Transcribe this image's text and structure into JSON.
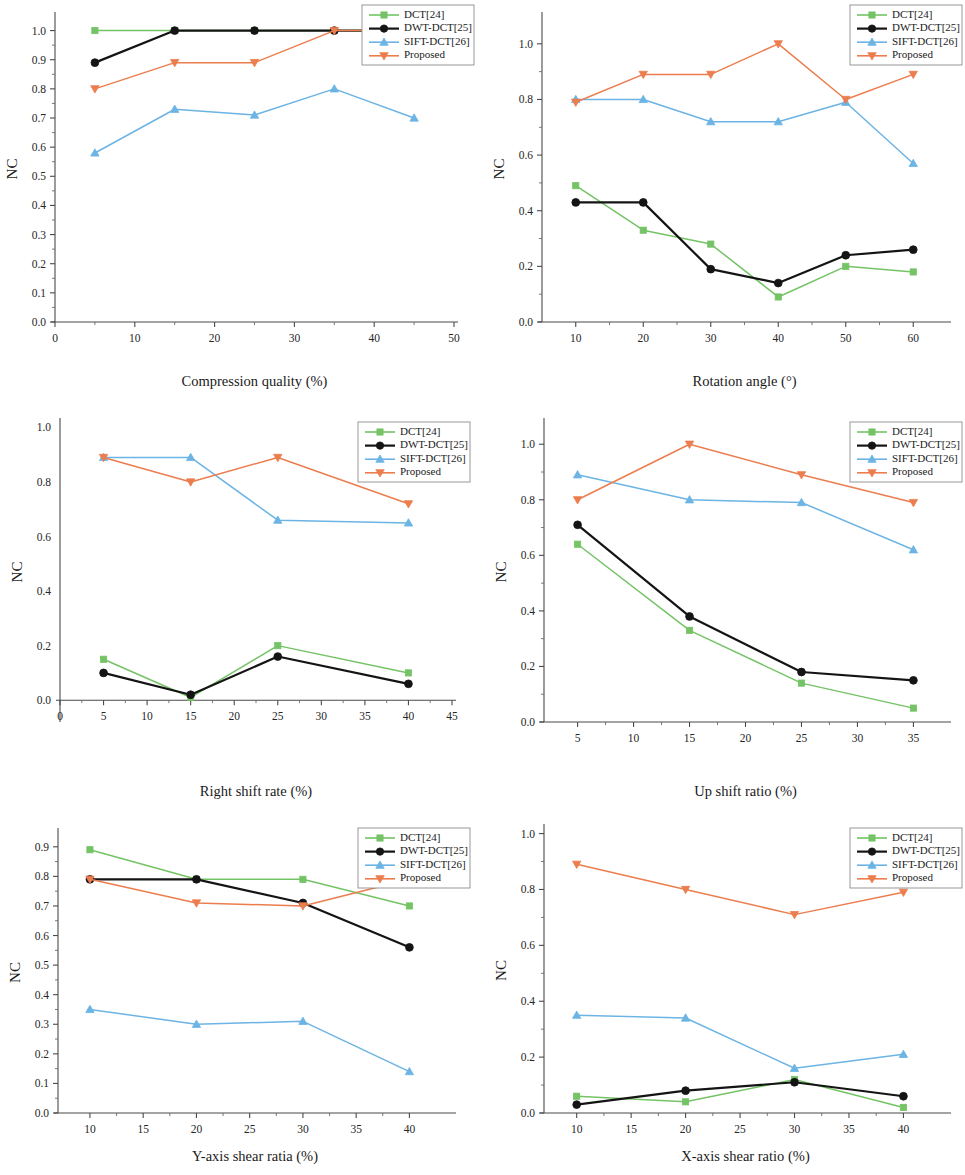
{
  "figure": {
    "series_names": [
      "DCT[24]",
      "DWT-DCT[25]",
      "SIFT-DCT[26]",
      "Proposed"
    ],
    "series_colors": [
      "#74C365",
      "#141414",
      "#6CB4E4",
      "#EC7D4E"
    ],
    "series_markers": [
      "square",
      "circle",
      "triangle-up",
      "triangle-down"
    ],
    "shared_ylabel": "NC"
  },
  "chart_data": [
    {
      "id": "compression-quality",
      "type": "line",
      "title": "",
      "xlabel": "Compression quality (%)",
      "ylabel": "NC",
      "x": [
        5,
        15,
        25,
        35,
        45
      ],
      "xlim": [
        0,
        50
      ],
      "ylim": [
        0.0,
        1.05
      ],
      "xticks": [
        0,
        10,
        20,
        30,
        40,
        50
      ],
      "xtick_labels": [
        "0",
        "10",
        "20",
        "30",
        "40",
        "50"
      ],
      "yticks": [
        0.0,
        0.1,
        0.2,
        0.3,
        0.4,
        0.5,
        0.6,
        0.7,
        0.8,
        0.9,
        1.0
      ],
      "ytick_labels": [
        "0.0",
        "0.1",
        "0.2",
        "0.3",
        "0.4",
        "0.5",
        "0.6",
        "0.7",
        "0.8",
        "0.9",
        "1.0"
      ],
      "grid": false,
      "legend_position": "top-right",
      "series": [
        {
          "name": "DCT[24]",
          "values": [
            1.0,
            1.0,
            1.0,
            1.0,
            1.0
          ]
        },
        {
          "name": "DWT-DCT[25]",
          "values": [
            0.89,
            1.0,
            1.0,
            1.0,
            1.0
          ]
        },
        {
          "name": "SIFT-DCT[26]",
          "values": [
            0.58,
            0.73,
            0.71,
            0.8,
            0.7
          ]
        },
        {
          "name": "Proposed",
          "values": [
            0.8,
            0.89,
            0.89,
            1.0,
            1.0
          ]
        }
      ]
    },
    {
      "id": "rotation-angle",
      "type": "line",
      "title": "",
      "xlabel": "Rotation angle (°)",
      "ylabel": "NC",
      "x": [
        10,
        20,
        30,
        40,
        50,
        60
      ],
      "xlim": [
        5,
        65
      ],
      "ylim": [
        0.0,
        1.1
      ],
      "xticks": [
        10,
        20,
        30,
        40,
        50,
        60
      ],
      "xtick_labels": [
        "10",
        "20",
        "30",
        "40",
        "50",
        "60"
      ],
      "yticks": [
        0.0,
        0.2,
        0.4,
        0.6,
        0.8,
        1.0
      ],
      "ytick_labels": [
        "0.0",
        "0.2",
        "0.4",
        "0.6",
        "0.8",
        "1.0"
      ],
      "grid": false,
      "legend_position": "top-right",
      "series": [
        {
          "name": "DCT[24]",
          "values": [
            0.49,
            0.33,
            0.28,
            0.09,
            0.2,
            0.18
          ]
        },
        {
          "name": "DWT-DCT[25]",
          "values": [
            0.43,
            0.43,
            0.19,
            0.14,
            0.24,
            0.26
          ]
        },
        {
          "name": "SIFT-DCT[26]",
          "values": [
            0.8,
            0.8,
            0.72,
            0.72,
            0.79,
            0.57
          ]
        },
        {
          "name": "Proposed",
          "values": [
            0.79,
            0.89,
            0.89,
            1.0,
            0.8,
            0.89
          ]
        }
      ]
    },
    {
      "id": "right-shift-rate",
      "type": "line",
      "title": "",
      "xlabel": "Right shift rate (%)",
      "ylabel": "NC",
      "x": [
        5,
        15,
        25,
        40
      ],
      "xlim": [
        0,
        45
      ],
      "ylim": [
        -0.08,
        1.02
      ],
      "xticks": [
        0,
        5,
        10,
        15,
        20,
        25,
        30,
        35,
        40,
        45
      ],
      "xtick_labels": [
        "0",
        "5",
        "10",
        "15",
        "20",
        "25",
        "30",
        "35",
        "40",
        "45"
      ],
      "yticks": [
        0.0,
        0.2,
        0.4,
        0.6,
        0.8,
        1.0
      ],
      "ytick_labels": [
        "0.0",
        "0.2",
        "0.4",
        "0.6",
        "0.8",
        "1.0"
      ],
      "grid": false,
      "legend_position": "top-right",
      "series": [
        {
          "name": "DCT[24]",
          "values": [
            0.15,
            0.01,
            0.2,
            0.1
          ]
        },
        {
          "name": "DWT-DCT[25]",
          "values": [
            0.1,
            0.02,
            0.16,
            0.06
          ]
        },
        {
          "name": "SIFT-DCT[26]",
          "values": [
            0.89,
            0.89,
            0.66,
            0.65
          ]
        },
        {
          "name": "Proposed",
          "values": [
            0.89,
            0.8,
            0.89,
            0.72
          ]
        }
      ]
    },
    {
      "id": "up-shift-ratio",
      "type": "line",
      "title": "",
      "xlabel": "Up shift ratio (%)",
      "ylabel": "NC",
      "x": [
        5,
        15,
        25,
        35
      ],
      "xlim": [
        2,
        38
      ],
      "ylim": [
        0.0,
        1.08
      ],
      "xticks": [
        5,
        10,
        15,
        20,
        25,
        30,
        35
      ],
      "xtick_labels": [
        "5",
        "10",
        "15",
        "20",
        "25",
        "30",
        "35"
      ],
      "yticks": [
        0.0,
        0.2,
        0.4,
        0.6,
        0.8,
        1.0
      ],
      "ytick_labels": [
        "0.0",
        "0.2",
        "0.4",
        "0.6",
        "0.8",
        "1.0"
      ],
      "grid": false,
      "legend_position": "top-right",
      "series": [
        {
          "name": "DCT[24]",
          "values": [
            0.64,
            0.33,
            0.14,
            0.05
          ]
        },
        {
          "name": "DWT-DCT[25]",
          "values": [
            0.71,
            0.38,
            0.18,
            0.15
          ]
        },
        {
          "name": "SIFT-DCT[26]",
          "values": [
            0.89,
            0.8,
            0.79,
            0.62
          ]
        },
        {
          "name": "Proposed",
          "values": [
            0.8,
            1.0,
            0.89,
            0.79
          ]
        }
      ]
    },
    {
      "id": "y-axis-shear-ratio",
      "type": "line",
      "title": "",
      "xlabel": "Y-axis shear ratia (%)",
      "ylabel": "NC",
      "x": [
        10,
        20,
        30,
        40
      ],
      "xlim": [
        7,
        44
      ],
      "ylim": [
        0.0,
        0.95
      ],
      "xticks": [
        10,
        15,
        20,
        25,
        30,
        35,
        40
      ],
      "xtick_labels": [
        "10",
        "15",
        "20",
        "25",
        "30",
        "35",
        "40"
      ],
      "yticks": [
        0.0,
        0.1,
        0.2,
        0.3,
        0.4,
        0.5,
        0.6,
        0.7,
        0.8,
        0.9
      ],
      "ytick_labels": [
        "0.0",
        "0.1",
        "0.2",
        "0.3",
        "0.4",
        "0.5",
        "0.6",
        "0.7",
        "0.8",
        "0.9"
      ],
      "grid": false,
      "legend_position": "top-right",
      "series": [
        {
          "name": "DCT[24]",
          "values": [
            0.89,
            0.79,
            0.79,
            0.7
          ]
        },
        {
          "name": "DWT-DCT[25]",
          "values": [
            0.79,
            0.79,
            0.71,
            0.56
          ]
        },
        {
          "name": "SIFT-DCT[26]",
          "values": [
            0.35,
            0.3,
            0.31,
            0.14
          ]
        },
        {
          "name": "Proposed",
          "values": [
            0.79,
            0.71,
            0.7,
            0.79
          ]
        }
      ]
    },
    {
      "id": "x-axis-shear-ratio",
      "type": "line",
      "title": "",
      "xlabel": "X-axis shear ratio (%)",
      "ylabel": "NC",
      "x": [
        10,
        20,
        30,
        40
      ],
      "xlim": [
        7,
        44
      ],
      "ylim": [
        0.0,
        1.02
      ],
      "xticks": [
        10,
        15,
        20,
        25,
        30,
        35,
        40
      ],
      "xtick_labels": [
        "10",
        "15",
        "20",
        "25",
        "30",
        "35",
        "40"
      ],
      "yticks": [
        0.0,
        0.2,
        0.4,
        0.6,
        0.8,
        1.0
      ],
      "ytick_labels": [
        "0.0",
        "0.2",
        "0.4",
        "0.6",
        "0.8",
        "1.0"
      ],
      "grid": false,
      "legend_position": "top-right",
      "series": [
        {
          "name": "DCT[24]",
          "values": [
            0.06,
            0.04,
            0.12,
            0.02
          ]
        },
        {
          "name": "DWT-DCT[25]",
          "values": [
            0.03,
            0.08,
            0.11,
            0.06
          ]
        },
        {
          "name": "SIFT-DCT[26]",
          "values": [
            0.35,
            0.34,
            0.16,
            0.21
          ]
        },
        {
          "name": "Proposed",
          "values": [
            0.89,
            0.8,
            0.71,
            0.79
          ]
        }
      ]
    }
  ]
}
